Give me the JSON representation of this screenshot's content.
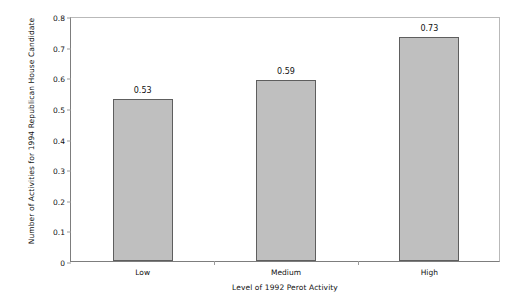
{
  "chart_data": {
    "type": "bar",
    "title": "",
    "categories": [
      "Low",
      "Medium",
      "High"
    ],
    "values": [
      0.53,
      0.59,
      0.73
    ],
    "data_labels": [
      "0.53",
      "0.59",
      "0.73"
    ],
    "xlabel": "Level of 1992 Perot Activity",
    "ylabel": "Number of Activities for 1994 Republican House Candidate",
    "ylim": [
      0,
      0.8
    ],
    "ytick_labels": [
      "0",
      "0.1",
      "0.2",
      "0.3",
      "0.4",
      "0.5",
      "0.6",
      "0.7",
      "0.8"
    ],
    "ytick_values": [
      0,
      0.1,
      0.2,
      0.3,
      0.4,
      0.5,
      0.6,
      0.7,
      0.8
    ],
    "grid": false,
    "legend": null,
    "series": [
      {
        "name": "Number of Activities for 1994 Republican House Candidate",
        "values": [
          0.53,
          0.59,
          0.73
        ],
        "color": "#bfbfbf",
        "edge_color": "#5e5e5e"
      }
    ]
  }
}
